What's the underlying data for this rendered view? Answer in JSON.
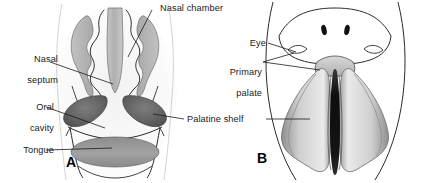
{
  "figure": {
    "type": "anatomical-diagram",
    "title_visible": false,
    "background_color": "#ffffff",
    "panels": [
      {
        "id": "A",
        "letter": "A",
        "view": "coronal-section-head",
        "labels": [
          "Nasal chamber",
          "Nasal septum",
          "Oral cavity",
          "Palatine shelf",
          "Tongue"
        ]
      },
      {
        "id": "B",
        "letter": "B",
        "view": "ventral-view-palate",
        "labels": [
          "Eye",
          "Primary palate",
          "Palatine shelf"
        ]
      }
    ]
  },
  "labels": {
    "nasal_chamber": "Nasal chamber",
    "nasal_septum_line1": "Nasal",
    "nasal_septum_line2": "septum",
    "oral_cavity_line1": "Oral",
    "oral_cavity_line2": "cavity",
    "tongue": "Tongue",
    "palatine_shelf": "Palatine shelf",
    "eye": "Eye",
    "primary_palate_line1": "Primary",
    "primary_palate_line2": "palate",
    "panel_a_letter": "A",
    "panel_b_letter": "B"
  },
  "colors": {
    "ink": "#1a1a1a",
    "outline": "#2b2b2b",
    "septum_fill": "#b9b9b9",
    "concha_fill": "#b4b4b4",
    "palatine_shelf_fill": "#6e6e6e",
    "tongue_fill": "#9a9a9a",
    "panel_b_shelf_fill": "#c9c9c9",
    "panel_b_cleft_fill": "#1c1c1c",
    "nostril_fill": "#111111",
    "background": "#ffffff"
  }
}
